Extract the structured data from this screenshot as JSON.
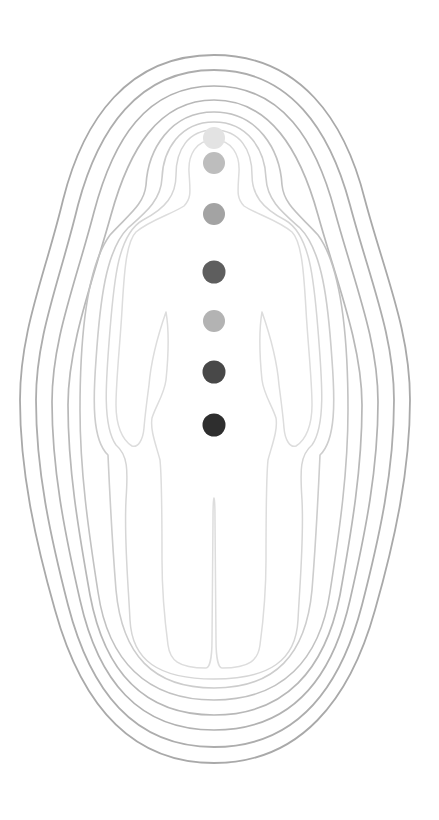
{
  "illustration": {
    "subject": "human aura with chakra points",
    "background": "#ffffff",
    "center_x": 214,
    "aura_layers": [
      {
        "name": "aura-layer-1",
        "color": "#a9a9a9",
        "width": 1.8
      },
      {
        "name": "aura-layer-2",
        "color": "#adadad",
        "width": 1.8
      },
      {
        "name": "aura-layer-3",
        "color": "#b2b2b2",
        "width": 1.7
      },
      {
        "name": "aura-layer-4",
        "color": "#b8b8b8",
        "width": 1.7
      },
      {
        "name": "aura-layer-5",
        "color": "#c2c2c2",
        "width": 1.6
      },
      {
        "name": "aura-layer-6",
        "color": "#cdcdcd",
        "width": 1.6
      },
      {
        "name": "aura-layer-7",
        "color": "#d6d6d6",
        "width": 1.5
      },
      {
        "name": "body-outline",
        "color": "#dddddd",
        "width": 1.5
      }
    ],
    "chakras": [
      {
        "name": "crown",
        "cx": 214,
        "cy": 138,
        "r": 11,
        "color": "#e3e3e3"
      },
      {
        "name": "third-eye",
        "cx": 214,
        "cy": 163,
        "r": 11,
        "color": "#bdbdbd"
      },
      {
        "name": "throat",
        "cx": 214,
        "cy": 214,
        "r": 11,
        "color": "#a3a3a3"
      },
      {
        "name": "heart",
        "cx": 214,
        "cy": 272,
        "r": 11.5,
        "color": "#5e5e5e"
      },
      {
        "name": "solar-plexus",
        "cx": 214,
        "cy": 321,
        "r": 11,
        "color": "#b3b3b3"
      },
      {
        "name": "sacral",
        "cx": 214,
        "cy": 372,
        "r": 11.5,
        "color": "#484848"
      },
      {
        "name": "root",
        "cx": 214,
        "cy": 425,
        "r": 11.5,
        "color": "#2e2e2e"
      }
    ]
  }
}
